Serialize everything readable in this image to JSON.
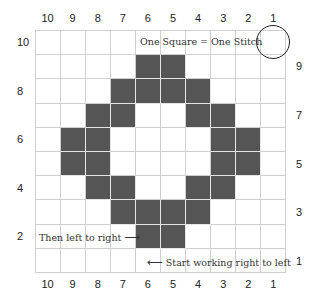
{
  "chart": {
    "legend_text": "One Square = One Stitch",
    "left_note": "Then left to right",
    "left_note_arrow": "⟶",
    "right_note": "Start working right to left",
    "right_note_arrow": "⟵",
    "column_labels": [
      "10",
      "9",
      "8",
      "7",
      "6",
      "5",
      "4",
      "3",
      "2",
      "1"
    ],
    "left_row_labels": [
      {
        "label": "10",
        "row": 0
      },
      {
        "label": "8",
        "row": 2
      },
      {
        "label": "6",
        "row": 4
      },
      {
        "label": "4",
        "row": 6
      },
      {
        "label": "2",
        "row": 8
      }
    ],
    "right_row_labels": [
      {
        "label": "9",
        "row": 1
      },
      {
        "label": "7",
        "row": 3
      },
      {
        "label": "5",
        "row": 5
      },
      {
        "label": "3",
        "row": 7
      },
      {
        "label": "1",
        "row": 9
      }
    ],
    "filled_color": "#555555",
    "grid_rows_top_to_bottom": [
      [
        0,
        0,
        0,
        0,
        0,
        0,
        0,
        0,
        0,
        0
      ],
      [
        0,
        0,
        0,
        0,
        1,
        1,
        0,
        0,
        0,
        0
      ],
      [
        0,
        0,
        0,
        1,
        1,
        1,
        1,
        0,
        0,
        0
      ],
      [
        0,
        0,
        1,
        1,
        0,
        0,
        1,
        1,
        0,
        0
      ],
      [
        0,
        1,
        1,
        0,
        0,
        0,
        0,
        1,
        1,
        0
      ],
      [
        0,
        1,
        1,
        0,
        0,
        0,
        0,
        1,
        1,
        0
      ],
      [
        0,
        0,
        1,
        1,
        0,
        0,
        1,
        1,
        0,
        0
      ],
      [
        0,
        0,
        0,
        1,
        1,
        1,
        1,
        0,
        0,
        0
      ],
      [
        0,
        0,
        0,
        0,
        1,
        1,
        0,
        0,
        0,
        0
      ],
      [
        0,
        0,
        0,
        0,
        0,
        0,
        0,
        0,
        0,
        0
      ]
    ]
  }
}
